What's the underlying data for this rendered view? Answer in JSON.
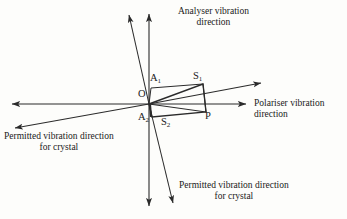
{
  "figure": {
    "background_color": "#fdfdfb",
    "line_color": "#2b2b2b",
    "text_color": "#1a1a1a"
  },
  "captions": {
    "analyser": "Analyser vibration\ndirection",
    "polariser": "Polariser vibration\ndirection",
    "crystal_left": "Permitted vibration direction\nfor crystal",
    "crystal_bottom": "Permitted vibration direction\nfor crystal"
  },
  "points": {
    "O": "O",
    "A1": "A",
    "A1_sub": "1",
    "S1": "S",
    "S1_sub": "1",
    "A2": "A",
    "A2_sub": "2",
    "S2": "S",
    "S2_sub": "2",
    "P": "P"
  },
  "chart_data": {
    "type": "diagram",
    "origin": {
      "x": 149,
      "y": 104,
      "label": "O"
    },
    "axes": [
      {
        "name": "analyser-axis",
        "label": "Analyser vibration direction",
        "orientation": "vertical",
        "from": {
          "x": 149,
          "y": 208
        },
        "to": {
          "x": 149,
          "y": 12
        },
        "double_headed": true
      },
      {
        "name": "polariser-axis",
        "label": "Polariser vibration direction",
        "orientation": "horizontal",
        "from": {
          "x": 10,
          "y": 104
        },
        "to": {
          "x": 248,
          "y": 104
        },
        "double_headed": true
      },
      {
        "name": "crystal-axis-shallow",
        "label": "Permitted vibration direction for crystal",
        "orientation": "shallow-diagonal",
        "from": {
          "x": 13,
          "y": 128
        },
        "to": {
          "x": 263,
          "y": 82
        },
        "double_headed": true
      },
      {
        "name": "crystal-axis-steep",
        "label": "Permitted vibration direction for crystal",
        "orientation": "steep-diagonal",
        "from": {
          "x": 127,
          "y": 12
        },
        "to": {
          "x": 174,
          "y": 206
        },
        "double_headed": true
      }
    ],
    "vertices": [
      {
        "label": "A1",
        "x": 151,
        "y": 88
      },
      {
        "label": "S1",
        "x": 203,
        "y": 84
      },
      {
        "label": "P",
        "x": 206,
        "y": 112
      },
      {
        "label": "A2",
        "x": 150,
        "y": 112
      },
      {
        "label": "S2",
        "x": 169,
        "y": 115
      }
    ],
    "shapes": [
      {
        "name": "rectangle-O-A1-S1-P",
        "points": [
          [
            149,
            104
          ],
          [
            151,
            88
          ],
          [
            203,
            84
          ],
          [
            206,
            112
          ]
        ],
        "closed": true
      },
      {
        "name": "parallelogram-O-S1-P-S2",
        "points": [
          [
            149,
            104
          ],
          [
            203,
            84
          ],
          [
            206,
            112
          ],
          [
            152,
            117
          ]
        ],
        "closed": true
      }
    ]
  }
}
